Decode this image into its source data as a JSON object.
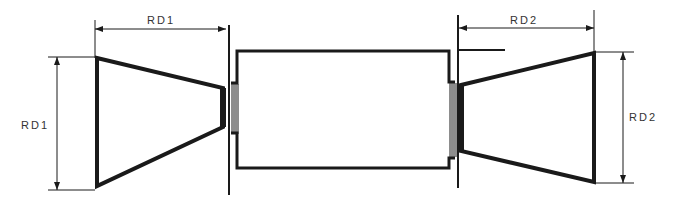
{
  "diagram": {
    "labels": {
      "left_width": "RD1",
      "left_height": "RD1",
      "right_width": "RD2",
      "right_height": "RD2"
    },
    "colors": {
      "stroke": "#1a1a1a",
      "background": "#ffffff",
      "text": "#333333"
    }
  }
}
